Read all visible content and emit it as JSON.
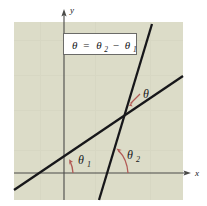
{
  "figure": {
    "panel": {
      "fill_color": "#dcdcc8",
      "x": 14,
      "y": 22,
      "width": 169,
      "height": 178
    },
    "axes": {
      "color": "#4a4a48",
      "x_axis_label": "x",
      "y_axis_label": "y",
      "x_axis_y": 173,
      "y_axis_x": 64
    },
    "equation_box": {
      "border_color": "#6b6b68",
      "fill_color": "#ffffff",
      "theta": "θ",
      "equals": "=",
      "theta_2": "θ",
      "subscript_2": "2",
      "minus": "−",
      "theta_1": "θ",
      "subscript_1": "1",
      "full_text": "θ = θ₂ − θ₁"
    },
    "lines": [
      {
        "name": "shallow-line",
        "color": "#17171a",
        "x1": 14,
        "y1": 190,
        "x2": 183,
        "y2": 76
      },
      {
        "name": "steep-line",
        "color": "#17171a",
        "x1": 152,
        "y1": 24,
        "x2": 99,
        "y2": 200
      }
    ],
    "annotations": {
      "arrow_color": "#b25a55",
      "items": [
        {
          "name": "theta-label",
          "symbol": "θ",
          "subscript": "",
          "x": 143,
          "y": 98
        },
        {
          "name": "theta-1-label",
          "symbol": "θ",
          "subscript": "1",
          "x": 78,
          "y": 164
        },
        {
          "name": "theta-2-label",
          "symbol": "θ",
          "subscript": "2",
          "x": 127,
          "y": 159
        }
      ]
    },
    "intersection_point": {
      "x": 124,
      "y": 122
    }
  }
}
